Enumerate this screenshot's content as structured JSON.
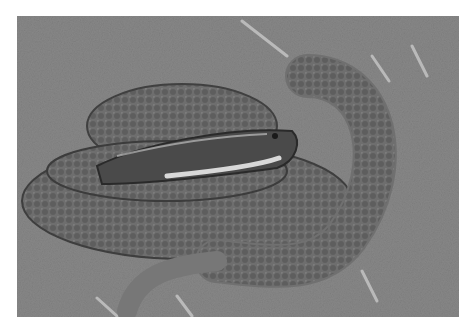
{
  "image": {
    "description": "Grayscale photograph of a coiled rattlesnake resting on dry sandy ground with scattered twigs",
    "subject": "coiled snake",
    "background": "dirt ground with dry grass and twigs",
    "tone": "monochrome"
  }
}
